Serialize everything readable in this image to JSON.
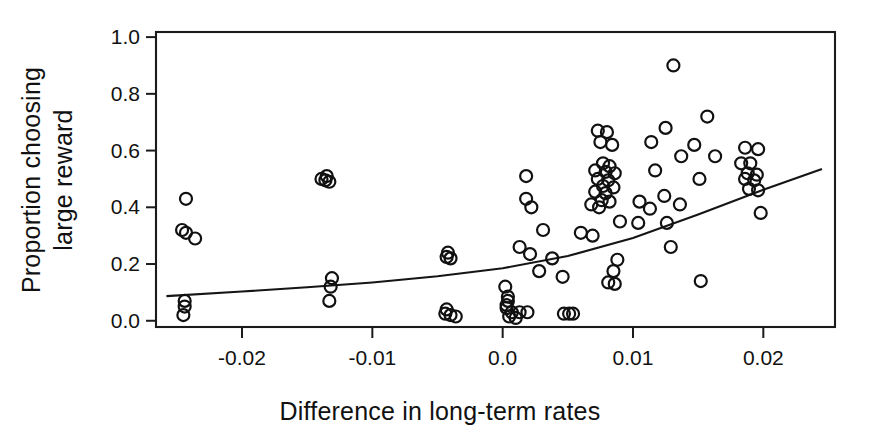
{
  "figure": {
    "background_color": "#ffffff",
    "ink_color": "#111111"
  },
  "chart_data": {
    "type": "scatter",
    "title": "",
    "subtitle": "",
    "xlabel": "Difference in long-term rates",
    "ylabel": "Proportion choosing large reward",
    "ylabel_lines": [
      "Proportion choosing",
      "large reward"
    ],
    "xlim": [
      -0.0266,
      0.0255
    ],
    "ylim": [
      -0.022,
      1.018
    ],
    "xticks": [
      -0.02,
      -0.01,
      0.0,
      0.01,
      0.02
    ],
    "xticklabels": [
      "-0.02",
      "-0.01",
      "0.0",
      "0.01",
      "0.02"
    ],
    "yticks": [
      0.0,
      0.2,
      0.4,
      0.6,
      0.8,
      1.0
    ],
    "yticklabels": [
      "0.0",
      "0.2",
      "0.4",
      "0.6",
      "0.8",
      "1.0"
    ],
    "grid": false,
    "legend": null,
    "marker": {
      "shape": "open-circle",
      "radius_px": 6,
      "fill": "none",
      "stroke": "#111111"
    },
    "series": [
      {
        "name": "observations",
        "points": [
          [
            -0.0243,
            0.43
          ],
          [
            -0.0246,
            0.32
          ],
          [
            -0.0243,
            0.31
          ],
          [
            -0.0236,
            0.29
          ],
          [
            -0.0244,
            0.07
          ],
          [
            -0.0244,
            0.05
          ],
          [
            -0.0245,
            0.02
          ],
          [
            -0.0135,
            0.51
          ],
          [
            -0.0139,
            0.5
          ],
          [
            -0.0136,
            0.495
          ],
          [
            -0.0133,
            0.49
          ],
          [
            -0.0042,
            0.24
          ],
          [
            -0.0043,
            0.225
          ],
          [
            -0.004,
            0.22
          ],
          [
            -0.0131,
            0.15
          ],
          [
            -0.0132,
            0.12
          ],
          [
            -0.0133,
            0.07
          ],
          [
            -0.0043,
            0.04
          ],
          [
            -0.0044,
            0.025
          ],
          [
            -0.004,
            0.02
          ],
          [
            -0.0036,
            0.015
          ],
          [
            0.0018,
            0.51
          ],
          [
            0.0018,
            0.43
          ],
          [
            0.0022,
            0.4
          ],
          [
            0.0031,
            0.32
          ],
          [
            0.0013,
            0.26
          ],
          [
            0.0021,
            0.235
          ],
          [
            0.0038,
            0.22
          ],
          [
            0.0028,
            0.175
          ],
          [
            0.0046,
            0.155
          ],
          [
            0.0002,
            0.12
          ],
          [
            0.0004,
            0.085
          ],
          [
            0.0004,
            0.07
          ],
          [
            0.0003,
            0.055
          ],
          [
            0.0003,
            0.045
          ],
          [
            0.0007,
            0.03
          ],
          [
            0.0013,
            0.03
          ],
          [
            0.0019,
            0.03
          ],
          [
            0.0005,
            0.015
          ],
          [
            0.001,
            0.01
          ],
          [
            0.0047,
            0.025
          ],
          [
            0.0051,
            0.025
          ],
          [
            0.0054,
            0.025
          ],
          [
            0.0073,
            0.67
          ],
          [
            0.008,
            0.665
          ],
          [
            0.0075,
            0.63
          ],
          [
            0.0084,
            0.62
          ],
          [
            0.0077,
            0.555
          ],
          [
            0.0082,
            0.545
          ],
          [
            0.0071,
            0.53
          ],
          [
            0.0079,
            0.525
          ],
          [
            0.0086,
            0.52
          ],
          [
            0.0073,
            0.5
          ],
          [
            0.0081,
            0.495
          ],
          [
            0.0077,
            0.475
          ],
          [
            0.0085,
            0.47
          ],
          [
            0.0071,
            0.455
          ],
          [
            0.0079,
            0.45
          ],
          [
            0.0076,
            0.425
          ],
          [
            0.0082,
            0.42
          ],
          [
            0.0068,
            0.41
          ],
          [
            0.0074,
            0.4
          ],
          [
            0.009,
            0.35
          ],
          [
            0.0088,
            0.215
          ],
          [
            0.0069,
            0.3
          ],
          [
            0.006,
            0.31
          ],
          [
            0.0085,
            0.175
          ],
          [
            0.0081,
            0.135
          ],
          [
            0.0086,
            0.13
          ],
          [
            0.0131,
            0.9
          ],
          [
            0.0125,
            0.68
          ],
          [
            0.0114,
            0.63
          ],
          [
            0.0147,
            0.62
          ],
          [
            0.0137,
            0.58
          ],
          [
            0.0117,
            0.53
          ],
          [
            0.0157,
            0.72
          ],
          [
            0.0163,
            0.58
          ],
          [
            0.0151,
            0.5
          ],
          [
            0.0124,
            0.44
          ],
          [
            0.0105,
            0.42
          ],
          [
            0.0113,
            0.395
          ],
          [
            0.0136,
            0.41
          ],
          [
            0.0104,
            0.345
          ],
          [
            0.0126,
            0.345
          ],
          [
            0.0129,
            0.26
          ],
          [
            0.0152,
            0.14
          ],
          [
            0.0186,
            0.61
          ],
          [
            0.0196,
            0.605
          ],
          [
            0.0183,
            0.555
          ],
          [
            0.019,
            0.555
          ],
          [
            0.0188,
            0.52
          ],
          [
            0.0195,
            0.515
          ],
          [
            0.0186,
            0.5
          ],
          [
            0.0193,
            0.495
          ],
          [
            0.0189,
            0.465
          ],
          [
            0.0196,
            0.46
          ],
          [
            0.0198,
            0.38
          ]
        ]
      }
    ],
    "fit_line": {
      "name": "logistic-regression-fit",
      "description": "monotonically increasing fitted curve",
      "points": [
        [
          -0.0258,
          0.087
        ],
        [
          -0.02,
          0.103
        ],
        [
          -0.015,
          0.118
        ],
        [
          -0.01,
          0.135
        ],
        [
          -0.005,
          0.157
        ],
        [
          0.0,
          0.185
        ],
        [
          0.005,
          0.228
        ],
        [
          0.01,
          0.292
        ],
        [
          0.015,
          0.375
        ],
        [
          0.02,
          0.462
        ],
        [
          0.0245,
          0.535
        ]
      ]
    }
  }
}
